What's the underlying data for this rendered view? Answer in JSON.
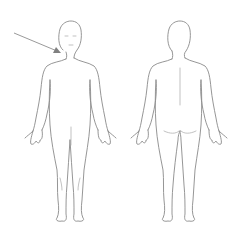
{
  "diagram": {
    "type": "body-map",
    "figures": [
      {
        "id": "front",
        "view": "anterior"
      },
      {
        "id": "back",
        "view": "posterior"
      }
    ],
    "annotation": {
      "type": "arrow",
      "target": "front-left-neck-shoulder",
      "color": "#8a8a8a"
    },
    "colors": {
      "background": "#ffffff",
      "outline": "#8a8a8a"
    }
  }
}
